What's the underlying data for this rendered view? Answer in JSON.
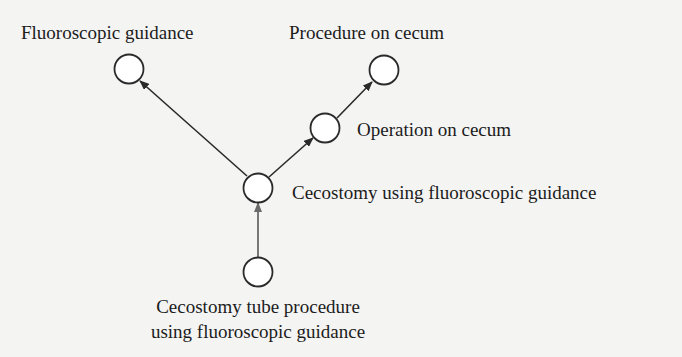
{
  "diagram": {
    "type": "directed-graph",
    "nodes": [
      {
        "id": "fluoroscopic_guidance",
        "label": "Fluoroscopic guidance"
      },
      {
        "id": "procedure_on_cecum",
        "label": "Procedure on cecum"
      },
      {
        "id": "operation_on_cecum",
        "label": "Operation on cecum"
      },
      {
        "id": "cecostomy_fluoro",
        "label": "Cecostomy using fluoroscopic guidance"
      },
      {
        "id": "cecostomy_tube",
        "label_line1": "Cecostomy tube procedure",
        "label_line2": "using fluoroscopic guidance"
      }
    ],
    "edges": [
      {
        "from": "cecostomy_tube",
        "to": "cecostomy_fluoro"
      },
      {
        "from": "cecostomy_fluoro",
        "to": "fluoroscopic_guidance"
      },
      {
        "from": "cecostomy_fluoro",
        "to": "operation_on_cecum"
      },
      {
        "from": "operation_on_cecum",
        "to": "procedure_on_cecum"
      }
    ],
    "colors": {
      "background": "#f4f4f3",
      "stroke": "#2a2a2a",
      "node_fill": "#ffffff",
      "text": "#1c1c1c"
    }
  }
}
